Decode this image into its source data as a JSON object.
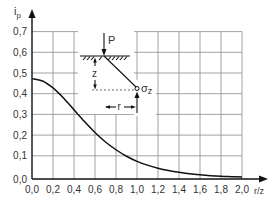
{
  "chart_data": {
    "type": "line",
    "title": "",
    "xlabel": "r/z",
    "ylabel": "i_p",
    "ylabel_main": "i",
    "ylabel_sub": "p",
    "xlim": [
      0.0,
      2.0
    ],
    "ylim": [
      0.0,
      0.7
    ],
    "grid": true,
    "legend": null,
    "x_ticks": [
      "0,0",
      "0,2",
      "0,4",
      "0,6",
      "0,8",
      "1,0",
      "1,2",
      "1,4",
      "1,6",
      "1,8",
      "2,0"
    ],
    "y_ticks": [
      "0,0",
      "0,1",
      "0,2",
      "0,3",
      "0,4",
      "0,5",
      "0,6",
      "0,7"
    ],
    "x": [
      0.0,
      0.1,
      0.2,
      0.3,
      0.4,
      0.5,
      0.6,
      0.7,
      0.8,
      0.9,
      1.0,
      1.1,
      1.2,
      1.3,
      1.4,
      1.5,
      1.6,
      1.7,
      1.8,
      1.9,
      2.0
    ],
    "series": [
      {
        "name": "i_p (Boussinesq point-load influence factor)",
        "values": [
          0.477,
          0.466,
          0.433,
          0.385,
          0.329,
          0.273,
          0.221,
          0.176,
          0.139,
          0.108,
          0.084,
          0.066,
          0.051,
          0.04,
          0.032,
          0.025,
          0.02,
          0.016,
          0.013,
          0.011,
          0.009
        ]
      }
    ],
    "inset_diagram": {
      "load_label": "P",
      "depth_label": "z",
      "radius_label": "r",
      "stress_label_main": "σ",
      "stress_label_sub": "z"
    }
  }
}
